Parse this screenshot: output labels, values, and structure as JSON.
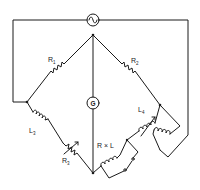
{
  "diagram": {
    "type": "AC bridge circuit (inductance bridge)",
    "components": {
      "source": {
        "symbol": "ac-source",
        "label": "~"
      },
      "galvanometer": {
        "label": "G"
      },
      "r1": {
        "label": "R",
        "sub": "1"
      },
      "r2": {
        "label": "R",
        "sub": "2"
      },
      "r3": {
        "label": "R",
        "sub": "3"
      },
      "l3": {
        "label": "L",
        "sub": "3"
      },
      "l4": {
        "label": "L",
        "sub": "4"
      },
      "unknown": {
        "label": "R × L"
      }
    }
  }
}
